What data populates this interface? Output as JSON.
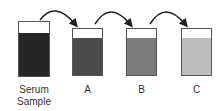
{
  "containers": [
    {
      "label": "Serum",
      "label2": "Sample",
      "color": "#262626"
    },
    {
      "label": "A",
      "color": "#4a4a4a"
    },
    {
      "label": "B",
      "color": "#7a7a7a"
    },
    {
      "label": "C",
      "color": "#bdbdbd"
    }
  ],
  "arrow_color": "#222222"
}
